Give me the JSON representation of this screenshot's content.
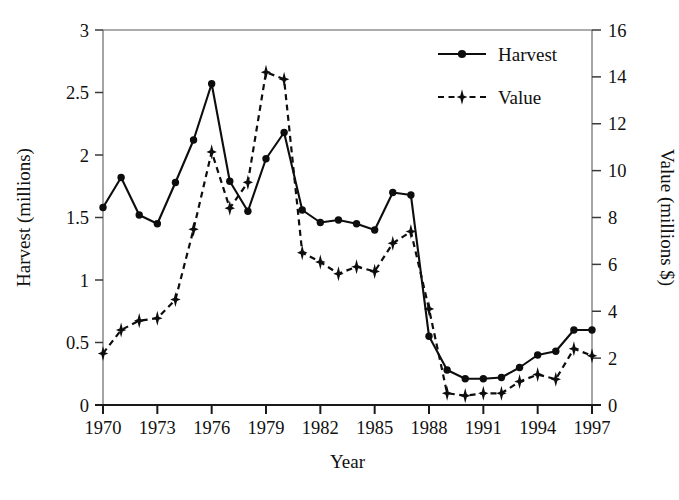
{
  "chart_data": {
    "type": "line",
    "title": "",
    "xlabel": "Year",
    "ylabel": "Harvest (millions)",
    "y2label": "Value (millions $)",
    "xlim": [
      1970,
      1997
    ],
    "ylim": [
      0,
      3
    ],
    "y2lim": [
      0,
      16
    ],
    "grid": false,
    "legend_position": "top-right",
    "xticks": [
      "1970",
      "1973",
      "1976",
      "1979",
      "1982",
      "1985",
      "1988",
      "1991",
      "1994",
      "1997"
    ],
    "xtick_values": [
      1970,
      1973,
      1976,
      1979,
      1982,
      1985,
      1988,
      1991,
      1994,
      1997
    ],
    "yticks": [
      "0",
      "0.5",
      "1",
      "1.5",
      "2",
      "2.5",
      "3"
    ],
    "ytick_values": [
      0,
      0.5,
      1,
      1.5,
      2,
      2.5,
      3
    ],
    "y2ticks": [
      "0",
      "2",
      "4",
      "6",
      "8",
      "10",
      "12",
      "14",
      "16"
    ],
    "y2tick_values": [
      0,
      2,
      4,
      6,
      8,
      10,
      12,
      14,
      16
    ],
    "x": [
      1970,
      1971,
      1972,
      1973,
      1974,
      1975,
      1976,
      1977,
      1978,
      1979,
      1980,
      1981,
      1982,
      1983,
      1984,
      1985,
      1986,
      1987,
      1988,
      1989,
      1990,
      1991,
      1992,
      1993,
      1994,
      1995,
      1996,
      1997
    ],
    "series": [
      {
        "name": "Harvest",
        "axis": "left",
        "line_style": "solid",
        "marker": "circle",
        "color": "#0d0d0d",
        "values": [
          1.58,
          1.82,
          1.52,
          1.45,
          1.78,
          2.12,
          2.57,
          1.79,
          1.55,
          1.97,
          2.18,
          1.56,
          1.46,
          1.48,
          1.45,
          1.4,
          1.7,
          1.68,
          0.55,
          0.28,
          0.21,
          0.21,
          0.22,
          0.3,
          0.4,
          0.43,
          0.6,
          0.6
        ]
      },
      {
        "name": "Value",
        "axis": "right",
        "line_style": "dashed",
        "marker": "diamond",
        "color": "#0d0d0d",
        "values": [
          2.2,
          3.2,
          3.6,
          3.7,
          4.5,
          7.5,
          10.8,
          8.4,
          9.5,
          14.2,
          13.9,
          6.5,
          6.1,
          5.6,
          5.9,
          5.7,
          6.9,
          7.4,
          4.1,
          0.5,
          0.4,
          0.5,
          0.5,
          1.0,
          1.3,
          1.1,
          2.4,
          2.1
        ]
      }
    ],
    "legend": [
      {
        "label": "Harvest",
        "marker": "circle",
        "line_style": "solid"
      },
      {
        "label": "Value",
        "marker": "diamond",
        "line_style": "dashed"
      }
    ]
  }
}
